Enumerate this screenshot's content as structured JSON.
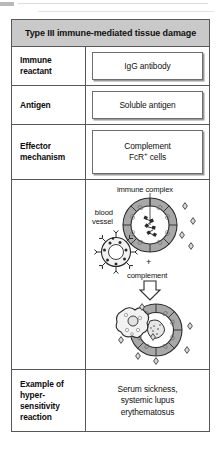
{
  "figure": {
    "title": "Type III immune-mediated tissue damage",
    "header_bg": "#c9c9c9",
    "border_color": "#58585a",
    "rows": [
      {
        "label": "Immune\nreactant",
        "label_line1": "Immune",
        "label_line2": "reactant",
        "value": "IgG antibody",
        "boxed": true
      },
      {
        "label": "Antigen",
        "value": "Soluble antigen",
        "boxed": true
      },
      {
        "label": "Effector\nmechanism",
        "label_line1": "Effector",
        "label_line2": "mechanism",
        "value_line1": "Complement",
        "value_line2": "FcR+ cells",
        "boxed": true
      },
      {
        "label": "",
        "value": "diagram",
        "boxed": false
      },
      {
        "label_line1": "Example of",
        "label_line2": "hyper-",
        "label_line3": "sensitivity",
        "label_line4": "reaction",
        "value_line1": "Serum sickness,",
        "value_line2": "systemic lupus",
        "value_line3": "erythematosus",
        "boxed": false
      }
    ]
  },
  "diagram": {
    "labels": {
      "immune_complex": "immune complex",
      "blood_vessel_line1": "blood",
      "blood_vessel_line2": "vessel",
      "complement": "complement",
      "plus": "+"
    },
    "colors": {
      "vessel_wall": "#a8a8a8",
      "vessel_wall_dark": "#8d8d8d",
      "outline": "#2b2b2b",
      "lumen": "#ffffff",
      "cell_fill": "#f0f0f0",
      "inflamed_fill": "#bdbdbd"
    },
    "elements": [
      "blood-vessel-cross-section",
      "immune-complex-deposits",
      "spiky-immune-cell",
      "complement-plus-sign",
      "down-arrow",
      "inflamed-vessel-with-infiltrating-cell",
      "scattered-immune-complexes"
    ]
  }
}
